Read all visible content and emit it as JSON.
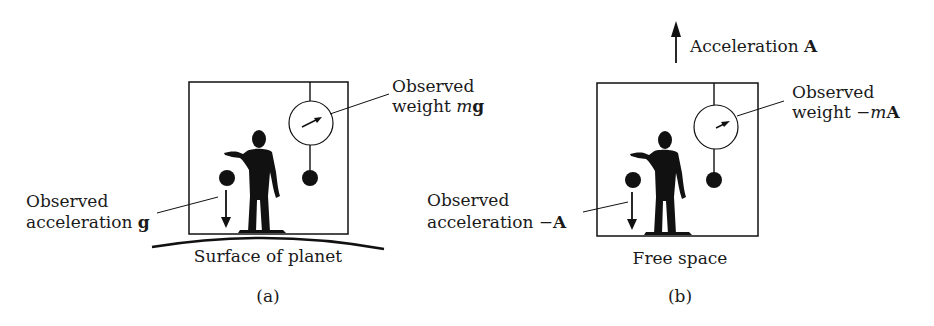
{
  "figure": {
    "panels": [
      {
        "id": "a",
        "caption": "(a)",
        "environment_label": "Surface of planet",
        "weight_label": {
          "line1": "Observed",
          "line2_prefix": "weight ",
          "line2_var": "m",
          "line2_vec": "g"
        },
        "accel_label": {
          "line1": "Observed",
          "line2_prefix": "acceleration ",
          "line2_vec": "g"
        }
      },
      {
        "id": "b",
        "caption": "(b)",
        "environment_label": "Free space",
        "box_acceleration_label": {
          "prefix": "Acceleration ",
          "vec": "A"
        },
        "weight_label": {
          "line1": "Observed",
          "line2_prefix": "weight  −",
          "line2_var": "m",
          "line2_vec": "A"
        },
        "accel_label": {
          "line1": "Observed",
          "line2_prefix": "acceleration  −",
          "line2_vec": "A"
        }
      }
    ],
    "colors": {
      "ink": "#111111",
      "background": "#ffffff"
    }
  }
}
